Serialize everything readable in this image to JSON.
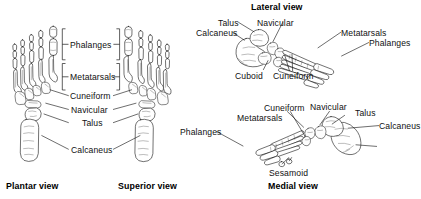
{
  "figure": {
    "background_color": "#ffffff",
    "line_color": "#1a1a1a",
    "text_color": "#111111"
  },
  "views": {
    "plantar": {
      "caption": "Plantar view",
      "labels": [
        {
          "key": "phalanges",
          "text": "Phalanges"
        },
        {
          "key": "metatarsals",
          "text": "Metatarsals"
        },
        {
          "key": "cuneiform",
          "text": "Cuneiform"
        },
        {
          "key": "navicular",
          "text": "Navicular"
        },
        {
          "key": "talus",
          "text": "Talus"
        },
        {
          "key": "calcaneus",
          "text": "Calcaneus"
        }
      ]
    },
    "superior": {
      "caption": "Superior view",
      "labels": [
        {
          "key": "phalanges",
          "text": "Phalanges"
        },
        {
          "key": "metatarsals",
          "text": "Metatarsals"
        },
        {
          "key": "cuneiform",
          "text": "Cuneiform"
        },
        {
          "key": "navicular",
          "text": "Navicular"
        },
        {
          "key": "talus",
          "text": "Talus"
        },
        {
          "key": "calcaneus",
          "text": "Calcaneus"
        }
      ]
    },
    "lateral": {
      "caption": "Lateral view",
      "labels": [
        {
          "key": "talus",
          "text": "Talus"
        },
        {
          "key": "navicular",
          "text": "Navicular"
        },
        {
          "key": "calcaneus",
          "text": "Calcaneus"
        },
        {
          "key": "metatarsals",
          "text": "Metatarsals"
        },
        {
          "key": "phalanges",
          "text": "Phalanges"
        },
        {
          "key": "cuboid",
          "text": "Cuboid"
        },
        {
          "key": "cuneiform",
          "text": "Cuneiform"
        }
      ]
    },
    "medial": {
      "caption": "Medial view",
      "labels": [
        {
          "key": "cuneiform",
          "text": "Cuneiform"
        },
        {
          "key": "navicular",
          "text": "Navicular"
        },
        {
          "key": "talus",
          "text": "Talus"
        },
        {
          "key": "metatarsals",
          "text": "Metatarsals"
        },
        {
          "key": "calcaneus",
          "text": "Calcaneus"
        },
        {
          "key": "phalanges",
          "text": "Phalanges"
        },
        {
          "key": "sesamoid",
          "text": "Sesamoid"
        }
      ]
    }
  }
}
